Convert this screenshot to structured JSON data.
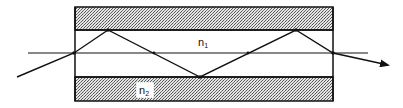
{
  "diagram": {
    "type": "optical-fiber-ray-diagram",
    "labels": {
      "core_index": "n",
      "core_index_sub": "1",
      "cladding_index": "n",
      "cladding_index_sub": "2"
    },
    "regions": [
      {
        "name": "top-cladding",
        "pattern": "stipple"
      },
      {
        "name": "core",
        "pattern": "none"
      },
      {
        "name": "bottom-cladding",
        "pattern": "stipple"
      }
    ],
    "ray_path_points": [
      [
        17,
        77
      ],
      [
        74,
        53
      ],
      [
        108,
        30
      ],
      [
        200,
        77
      ],
      [
        296,
        30
      ],
      [
        333,
        53
      ],
      [
        390,
        65
      ]
    ],
    "colors": {
      "line": "#111111",
      "stipple_dark": "#555555",
      "stipple_light": "#e6e6e6",
      "background": "#ffffff"
    }
  }
}
